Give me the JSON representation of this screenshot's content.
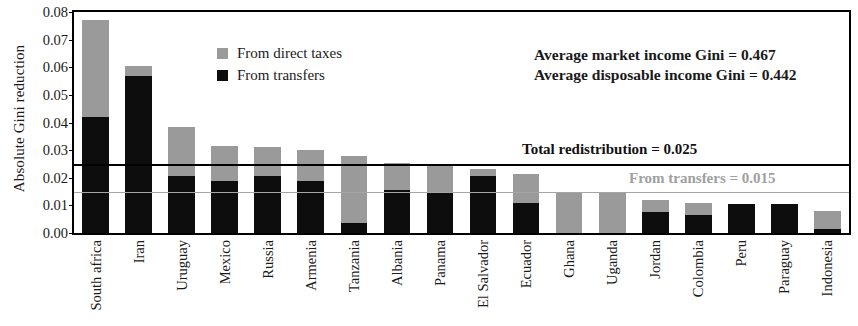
{
  "chart_data": {
    "type": "bar",
    "stacked": true,
    "title": "",
    "xlabel": "",
    "ylabel": "Absolute Gini reduction",
    "ylim": [
      0.0,
      0.08
    ],
    "ytick_labels": [
      "0.00",
      "0.01",
      "0.02",
      "0.03",
      "0.04",
      "0.05",
      "0.06",
      "0.07",
      "0.08"
    ],
    "ytick_values": [
      0.0,
      0.01,
      0.02,
      0.03,
      0.04,
      0.05,
      0.06,
      0.07,
      0.08
    ],
    "grid": false,
    "legend_position": "upper-left-inside",
    "categories": [
      "South africa",
      "Iran",
      "Uruguay",
      "Mexico",
      "Russia",
      "Armenia",
      "Tanzania",
      "Albania",
      "Panama",
      "El Salvador",
      "Ecuador",
      "Ghana",
      "Uganda",
      "Jordan",
      "Colombia",
      "Peru",
      "Paraguay",
      "Indonesia"
    ],
    "series": [
      {
        "name": "From transfers",
        "color": "#0d0d0d",
        "values": [
          0.042,
          0.057,
          0.0205,
          0.019,
          0.0205,
          0.019,
          0.0035,
          0.0155,
          0.015,
          0.0205,
          0.011,
          0.0,
          0.0,
          0.0075,
          0.0065,
          0.0105,
          0.0105,
          0.0015
        ]
      },
      {
        "name": "From direct taxes",
        "color": "#9a9a9a",
        "values": [
          0.035,
          0.0035,
          0.018,
          0.0125,
          0.0105,
          0.011,
          0.0245,
          0.01,
          0.0095,
          0.0025,
          0.0105,
          0.0145,
          0.0145,
          0.0045,
          0.0045,
          0.0,
          0.0,
          0.0065
        ]
      }
    ],
    "totals": [
      0.077,
      0.0605,
      0.0385,
      0.0315,
      0.031,
      0.03,
      0.028,
      0.0255,
      0.0245,
      0.023,
      0.0215,
      0.0145,
      0.0145,
      0.012,
      0.011,
      0.0105,
      0.0105,
      0.008
    ],
    "reference_lines": [
      {
        "name": "total-redistribution",
        "label": "Total redistribution = 0.025",
        "value": 0.025,
        "color": "#000000"
      },
      {
        "name": "from-transfers",
        "label": "From transfers = 0.015",
        "value": 0.015,
        "color": "#a6a6a6"
      }
    ],
    "annotations": [
      "Average market income Gini = 0.467",
      "Average disposable income Gini = 0.442"
    ]
  },
  "legend": {
    "items": [
      {
        "label": "From direct taxes",
        "color": "#9a9a9a",
        "swatch": "square-grey-icon"
      },
      {
        "label": "From transfers",
        "color": "#0d0d0d",
        "swatch": "square-black-icon"
      }
    ]
  },
  "axes": {
    "y_title": "Absolute Gini reduction"
  }
}
